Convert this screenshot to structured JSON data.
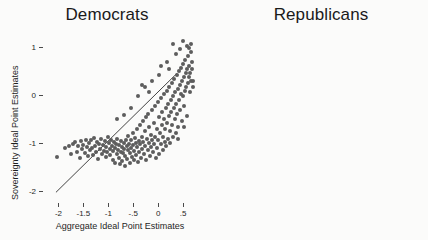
{
  "figure": {
    "background": "#fbfbfa",
    "point_color": "#5d5d5d",
    "line_color": "#2e2e2e"
  },
  "chart_data": [
    {
      "type": "scatter",
      "title": "Democrats",
      "xlabel": "Aggregate Ideal Point Estimates",
      "ylabel": "Sovereignty Ideal Point Estimates",
      "xlim": [
        -2.25,
        0.72
      ],
      "ylim": [
        -2.18,
        1.32
      ],
      "xticks": [
        -2,
        -1.5,
        -1,
        -0.5,
        0,
        0.5
      ],
      "xticklabels": [
        "-2",
        "-1.5",
        "-1",
        "-.5",
        "0",
        ".5"
      ],
      "yticks": [
        1,
        0,
        -1,
        -2
      ],
      "yticklabels": [
        "1",
        "0",
        "-1",
        "-2"
      ],
      "grid": false,
      "legend": "none",
      "n_points": 203,
      "fit_line": {
        "x0": -2.05,
        "y0": -2.02,
        "x1": 0.38,
        "y1": 0.46
      },
      "points": [
        [
          -2.02,
          -1.28
        ],
        [
          -1.86,
          -1.1
        ],
        [
          -1.79,
          -1.06
        ],
        [
          -1.74,
          -1.22
        ],
        [
          -1.7,
          -1.02
        ],
        [
          -1.66,
          -0.98
        ],
        [
          -1.63,
          -1.18
        ],
        [
          -1.6,
          -1.06
        ],
        [
          -1.57,
          -1.3
        ],
        [
          -1.55,
          -0.96
        ],
        [
          -1.52,
          -1.12
        ],
        [
          -1.5,
          -1.04
        ],
        [
          -1.47,
          -1.2
        ],
        [
          -1.45,
          -0.92
        ],
        [
          -1.43,
          -1.08
        ],
        [
          -1.41,
          -1.26
        ],
        [
          -1.39,
          -1.0
        ],
        [
          -1.37,
          -1.14
        ],
        [
          -1.35,
          -0.94
        ],
        [
          -1.33,
          -1.1
        ],
        [
          -1.31,
          -1.24
        ],
        [
          -1.29,
          -0.88
        ],
        [
          -1.27,
          -1.06
        ],
        [
          -1.25,
          -1.18
        ],
        [
          -1.23,
          -0.98
        ],
        [
          -1.21,
          -1.32
        ],
        [
          -1.19,
          -1.02
        ],
        [
          -1.17,
          -1.12
        ],
        [
          -1.15,
          -0.9
        ],
        [
          -1.13,
          -1.22
        ],
        [
          -1.11,
          -1.04
        ],
        [
          -1.09,
          -1.16
        ],
        [
          -1.07,
          -0.96
        ],
        [
          -1.05,
          -1.28
        ],
        [
          -1.04,
          -1.08
        ],
        [
          -1.02,
          -1.18
        ],
        [
          -1.0,
          -0.86
        ],
        [
          -0.99,
          -1.0
        ],
        [
          -0.97,
          -1.12
        ],
        [
          -0.96,
          -1.24
        ],
        [
          -0.94,
          -0.94
        ],
        [
          -0.93,
          -1.06
        ],
        [
          -0.91,
          -1.34
        ],
        [
          -0.9,
          -1.16
        ],
        [
          -0.88,
          -0.98
        ],
        [
          -0.87,
          -1.1
        ],
        [
          -0.86,
          -1.4
        ],
        [
          -0.84,
          -1.02
        ],
        [
          -0.83,
          -1.22
        ],
        [
          -0.82,
          -0.9
        ],
        [
          -0.8,
          -1.14
        ],
        [
          -0.79,
          -1.3
        ],
        [
          -0.78,
          -1.04
        ],
        [
          -0.77,
          -1.44
        ],
        [
          -0.75,
          -1.18
        ],
        [
          -0.74,
          -0.96
        ],
        [
          -0.73,
          -1.08
        ],
        [
          -0.72,
          -1.36
        ],
        [
          -0.7,
          -1.2
        ],
        [
          -0.69,
          -1.0
        ],
        [
          -0.68,
          -1.12
        ],
        [
          -0.67,
          -1.48
        ],
        [
          -0.66,
          -1.26
        ],
        [
          -0.64,
          -0.92
        ],
        [
          -0.63,
          -1.06
        ],
        [
          -0.62,
          -1.32
        ],
        [
          -0.61,
          -1.14
        ],
        [
          -0.6,
          -0.84
        ],
        [
          -0.58,
          -1.02
        ],
        [
          -0.57,
          -1.4
        ],
        [
          -0.56,
          -1.2
        ],
        [
          -0.55,
          -0.94
        ],
        [
          -0.54,
          -1.1
        ],
        [
          -0.52,
          -1.28
        ],
        [
          -0.51,
          -0.78
        ],
        [
          -0.5,
          -1.04
        ],
        [
          -0.49,
          -1.34
        ],
        [
          -0.48,
          -1.16
        ],
        [
          -0.46,
          -0.88
        ],
        [
          -0.45,
          -1.0
        ],
        [
          -0.44,
          -1.24
        ],
        [
          -0.43,
          -0.7
        ],
        [
          -0.42,
          -1.08
        ],
        [
          -0.4,
          -1.38
        ],
        [
          -0.39,
          -0.96
        ],
        [
          -0.38,
          -1.18
        ],
        [
          -0.37,
          -0.62
        ],
        [
          -0.36,
          -1.02
        ],
        [
          -0.34,
          -1.3
        ],
        [
          -0.33,
          -0.86
        ],
        [
          -0.32,
          -1.12
        ],
        [
          -0.31,
          -0.54
        ],
        [
          -0.3,
          -0.98
        ],
        [
          -0.28,
          -1.22
        ],
        [
          -0.27,
          -0.74
        ],
        [
          -0.26,
          -1.06
        ],
        [
          -0.25,
          -0.46
        ],
        [
          -0.24,
          -1.34
        ],
        [
          -0.22,
          -0.9
        ],
        [
          -0.21,
          -1.14
        ],
        [
          -0.2,
          -0.38
        ],
        [
          -0.19,
          -1.0
        ],
        [
          -0.18,
          -0.66
        ],
        [
          -0.16,
          -1.26
        ],
        [
          -0.15,
          -0.82
        ],
        [
          -0.14,
          -1.08
        ],
        [
          -0.13,
          -0.3
        ],
        [
          -0.12,
          -0.94
        ],
        [
          -0.1,
          -1.18
        ],
        [
          -0.09,
          -0.58
        ],
        [
          -0.08,
          -1.02
        ],
        [
          -0.07,
          -0.22
        ],
        [
          -0.06,
          -0.86
        ],
        [
          -0.04,
          -1.3
        ],
        [
          -0.03,
          -0.7
        ],
        [
          -0.02,
          -1.1
        ],
        [
          -0.01,
          -0.14
        ],
        [
          0.0,
          -0.94
        ],
        [
          0.01,
          -0.46
        ],
        [
          0.02,
          -1.22
        ],
        [
          0.03,
          -0.78
        ],
        [
          0.05,
          -0.06
        ],
        [
          0.06,
          -1.02
        ],
        [
          0.07,
          -0.62
        ],
        [
          0.08,
          -0.34
        ],
        [
          0.09,
          -1.14
        ],
        [
          0.1,
          -0.86
        ],
        [
          0.11,
          0.02
        ],
        [
          0.12,
          -0.5
        ],
        [
          0.13,
          -0.98
        ],
        [
          0.14,
          -0.7
        ],
        [
          0.15,
          -0.26
        ],
        [
          0.16,
          -1.06
        ],
        [
          0.17,
          0.1
        ],
        [
          0.18,
          -0.58
        ],
        [
          0.19,
          -0.9
        ],
        [
          0.2,
          -0.18
        ],
        [
          0.21,
          -0.42
        ],
        [
          0.22,
          0.18
        ],
        [
          0.23,
          -0.74
        ],
        [
          0.24,
          -1.0
        ],
        [
          0.25,
          -0.1
        ],
        [
          0.26,
          -0.34
        ],
        [
          0.27,
          0.26
        ],
        [
          0.28,
          -0.62
        ],
        [
          0.29,
          -0.86
        ],
        [
          0.3,
          -0.02
        ],
        [
          0.31,
          -0.26
        ],
        [
          0.32,
          0.34
        ],
        [
          0.33,
          -0.5
        ],
        [
          0.34,
          0.06
        ],
        [
          0.35,
          -0.78
        ],
        [
          0.36,
          -0.18
        ],
        [
          0.37,
          0.42
        ],
        [
          0.38,
          -0.38
        ],
        [
          0.39,
          0.14
        ],
        [
          0.4,
          -0.66
        ],
        [
          0.41,
          -0.1
        ],
        [
          0.42,
          0.5
        ],
        [
          0.43,
          0.22
        ],
        [
          0.44,
          -0.3
        ],
        [
          0.45,
          0.02
        ],
        [
          0.46,
          0.58
        ],
        [
          0.47,
          -0.54
        ],
        [
          0.48,
          0.3
        ],
        [
          0.49,
          -0.02
        ],
        [
          0.5,
          0.66
        ],
        [
          0.51,
          0.38
        ],
        [
          0.52,
          -0.22
        ],
        [
          0.53,
          0.1
        ],
        [
          0.54,
          0.74
        ],
        [
          0.55,
          0.46
        ],
        [
          0.56,
          0.18
        ],
        [
          0.57,
          -0.42
        ],
        [
          0.58,
          0.54
        ],
        [
          0.59,
          0.26
        ],
        [
          0.6,
          0.82
        ],
        [
          0.61,
          0.38
        ],
        [
          0.62,
          0.62
        ],
        [
          0.63,
          0.06
        ],
        [
          0.64,
          0.46
        ],
        [
          0.65,
          0.9
        ],
        [
          0.66,
          0.3
        ],
        [
          0.67,
          0.7
        ],
        [
          0.68,
          0.54
        ],
        [
          0.58,
          1.02
        ],
        [
          0.44,
          0.96
        ],
        [
          0.3,
          1.08
        ],
        [
          0.18,
          0.7
        ],
        [
          0.06,
          0.62
        ],
        [
          -0.12,
          0.3
        ],
        [
          -0.26,
          0.18
        ],
        [
          -0.4,
          -0.02
        ],
        [
          0.5,
          1.14
        ],
        [
          0.66,
          1.06
        ],
        [
          0.62,
          0.98
        ],
        [
          0.36,
          0.86
        ],
        [
          0.22,
          0.54
        ],
        [
          0.02,
          0.42
        ],
        [
          -0.18,
          0.06
        ],
        [
          -0.33,
          0.22
        ],
        [
          -0.55,
          -0.26
        ],
        [
          -0.68,
          -0.4
        ],
        [
          -0.82,
          -0.5
        ],
        [
          0.7,
          0.3
        ],
        [
          0.69,
          0.18
        ],
        [
          0.52,
          -0.66
        ],
        [
          0.4,
          -0.9
        ]
      ]
    },
    {
      "type": "scatter",
      "title": "Republicans",
      "xlabel": "Aggregate Ideal Point Estimates",
      "ylabel": "Sovereignty Ideal Point Estimates",
      "xlim": [
        0.42,
        2.72
      ],
      "ylim": [
        -0.08,
        2.12
      ],
      "xticks": [
        0.5,
        1,
        1.5,
        2,
        2.5
      ],
      "xticklabels": [
        ".5",
        "1",
        "1.5",
        "2",
        "2.5"
      ],
      "yticks": [
        2,
        1.5,
        1,
        0.5,
        0
      ],
      "yticklabels": [
        "2",
        "1.5",
        "1",
        ".5",
        "0"
      ],
      "grid": false,
      "legend": "none",
      "n_points": 95,
      "fit_line": {
        "x0": 0.52,
        "y0": 0.93,
        "x1": 2.52,
        "y1": 1.36
      },
      "points": [
        [
          0.68,
          0.38
        ],
        [
          0.7,
          0.5
        ],
        [
          0.72,
          1.32
        ],
        [
          0.74,
          0.74
        ],
        [
          0.76,
          1.18
        ],
        [
          0.78,
          0.86
        ],
        [
          0.8,
          1.54
        ],
        [
          0.82,
          1.5
        ],
        [
          0.8,
          0.6
        ],
        [
          0.84,
          1.34
        ],
        [
          0.86,
          1.86
        ],
        [
          0.88,
          1.02
        ],
        [
          0.9,
          0.88
        ],
        [
          0.92,
          1.26
        ],
        [
          0.94,
          1.44
        ],
        [
          0.96,
          0.56
        ],
        [
          0.98,
          1.12
        ],
        [
          1.0,
          1.64
        ],
        [
          1.02,
          0.92
        ],
        [
          1.04,
          1.38
        ],
        [
          1.06,
          0.58
        ],
        [
          1.08,
          0.7
        ],
        [
          1.1,
          1.3
        ],
        [
          1.12,
          0.96
        ],
        [
          1.14,
          1.5
        ],
        [
          1.16,
          0.6
        ],
        [
          1.18,
          1.2
        ],
        [
          1.2,
          0.5
        ],
        [
          1.22,
          1.42
        ],
        [
          1.24,
          1.74
        ],
        [
          1.26,
          0.98
        ],
        [
          1.28,
          1.34
        ],
        [
          1.3,
          0.18
        ],
        [
          1.3,
          1.94
        ],
        [
          1.32,
          1.26
        ],
        [
          1.34,
          0.62
        ],
        [
          1.36,
          1.46
        ],
        [
          1.38,
          1.1
        ],
        [
          1.4,
          0.42
        ],
        [
          1.42,
          1.58
        ],
        [
          1.44,
          1.3
        ],
        [
          1.46,
          0.84
        ],
        [
          1.48,
          1.4
        ],
        [
          1.5,
          1.02
        ],
        [
          1.52,
          1.66
        ],
        [
          1.54,
          1.24
        ],
        [
          1.56,
          0.76
        ],
        [
          1.58,
          1.48
        ],
        [
          1.6,
          1.14
        ],
        [
          1.62,
          1.82
        ],
        [
          1.64,
          1.36
        ],
        [
          1.66,
          1.7
        ],
        [
          1.66,
          1.86
        ],
        [
          1.68,
          1.54
        ],
        [
          1.7,
          1.28
        ],
        [
          1.72,
          1.44
        ],
        [
          1.74,
          1.06
        ],
        [
          1.76,
          0.54
        ],
        [
          1.78,
          1.62
        ],
        [
          1.8,
          1.22
        ],
        [
          1.82,
          0.16
        ],
        [
          1.84,
          1.4
        ],
        [
          1.86,
          0.78
        ],
        [
          1.88,
          1.32
        ],
        [
          1.9,
          1.08
        ],
        [
          1.92,
          0.72
        ],
        [
          1.94,
          1.52
        ],
        [
          1.96,
          1.94
        ],
        [
          1.96,
          0.74
        ],
        [
          1.98,
          1.18
        ],
        [
          2.0,
          0.8
        ],
        [
          2.02,
          1.26
        ],
        [
          2.04,
          1.08
        ],
        [
          2.06,
          0.16
        ],
        [
          2.08,
          1.44
        ],
        [
          2.1,
          1.96
        ],
        [
          2.12,
          0.16
        ],
        [
          2.56,
          1.68
        ],
        [
          1.46,
          1.32
        ],
        [
          1.34,
          1.12
        ],
        [
          1.22,
          0.86
        ],
        [
          1.1,
          0.64
        ],
        [
          0.96,
          1.06
        ],
        [
          0.84,
          1.22
        ],
        [
          1.5,
          0.6
        ],
        [
          1.62,
          0.4
        ],
        [
          1.72,
          1.16
        ],
        [
          1.86,
          1.34
        ],
        [
          1.4,
          0.2
        ],
        [
          1.26,
          0.36
        ],
        [
          1.06,
          1.46
        ],
        [
          0.9,
          1.6
        ],
        [
          1.56,
          0.96
        ],
        [
          1.18,
          1.64
        ],
        [
          1.3,
          0.68
        ]
      ]
    }
  ]
}
